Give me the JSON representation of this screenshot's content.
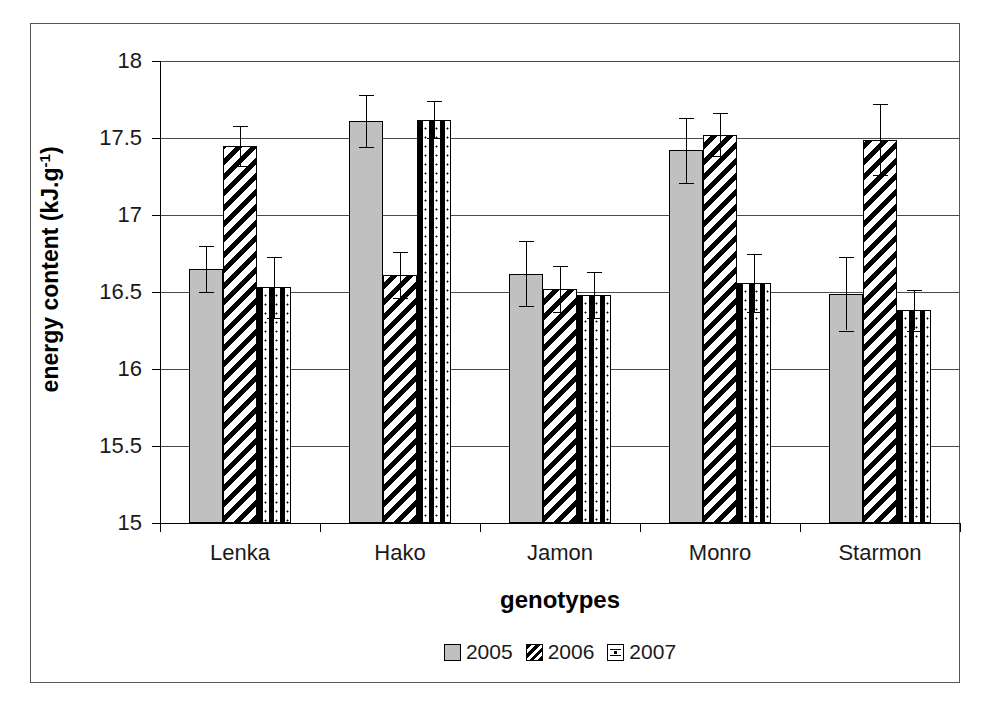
{
  "chart_data": {
    "type": "bar",
    "title": "",
    "xlabel": "genotypes",
    "ylabel_html": "energy content (kJ.g<sup>-1</sup>)",
    "ylabel_text": "energy content (kJ.g-1)",
    "categories": [
      "Lenka",
      "Hako",
      "Jamon",
      "Monro",
      "Starmon"
    ],
    "ylim": [
      15,
      18
    ],
    "ytick_labels": [
      "18",
      "17.5",
      "17",
      "16.5",
      "16",
      "15.5",
      "15"
    ],
    "ytick_values": [
      18,
      17.5,
      17,
      16.5,
      16,
      15.5,
      15
    ],
    "grid": true,
    "legend_position": "bottom",
    "series": [
      {
        "name": "2005",
        "pattern": "solid-gray",
        "color": "#c0c0c0",
        "values": [
          16.65,
          17.61,
          16.62,
          17.42,
          16.49
        ],
        "errors": [
          0.15,
          0.17,
          0.21,
          0.21,
          0.24
        ]
      },
      {
        "name": "2006",
        "pattern": "diagonal-hatch",
        "color": "#000000",
        "values": [
          17.45,
          16.61,
          16.52,
          17.52,
          17.49
        ],
        "errors": [
          0.13,
          0.15,
          0.15,
          0.14,
          0.23
        ]
      },
      {
        "name": "2007",
        "pattern": "dotted",
        "color": "#ffffff",
        "values": [
          16.53,
          17.62,
          16.48,
          16.56,
          16.38
        ],
        "errors": [
          0.2,
          0.12,
          0.15,
          0.19,
          0.13
        ]
      }
    ]
  },
  "legend": {
    "items": [
      {
        "label": "2005",
        "swatch": "solid-gray-swatch"
      },
      {
        "label": "2006",
        "swatch": "diagonal-hatch-swatch"
      },
      {
        "label": "2007",
        "swatch": "dotted-swatch"
      }
    ]
  }
}
